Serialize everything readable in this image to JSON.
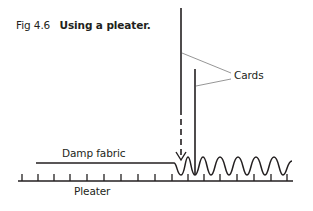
{
  "figure": {
    "number": "Fig 4.6",
    "title": "Using a pleater."
  },
  "labels": {
    "cards": "Cards",
    "damp_fabric": "Damp fabric",
    "pleater": "Pleater"
  },
  "colors": {
    "ink": "#231f20",
    "leader": "#8a8a8a",
    "background": "#ffffff"
  }
}
